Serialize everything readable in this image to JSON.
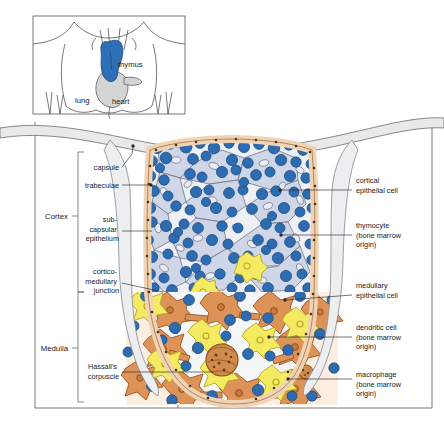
{
  "figure": {
    "type": "anatomical-histology-diagram"
  },
  "inset": {
    "name": "thorax-location-inset",
    "labels": [
      {
        "id": "thymus",
        "text": "thymus",
        "x": 118,
        "y": 67
      },
      {
        "id": "lung",
        "text": "lung",
        "x": 75,
        "y": 103
      },
      {
        "id": "heart",
        "text": "heart",
        "x": 112,
        "y": 104
      }
    ],
    "colors": {
      "thymus": "#2f6fb5",
      "heart": "#d4d4d4",
      "outline": "#4a4a4a"
    }
  },
  "regions": [
    {
      "id": "cortex",
      "label": "Cortex",
      "x": 46,
      "y": 216,
      "top": 152,
      "bottom": 292
    },
    {
      "id": "medulla",
      "label": "Medulla",
      "x": 43,
      "y": 348,
      "top": 292,
      "bottom": 402
    }
  ],
  "left_labels": [
    {
      "id": "capsule",
      "lines": [
        "capsule"
      ],
      "x": 119,
      "y": 170,
      "anchor": "end",
      "leader": [
        [
          122,
          167
        ],
        [
          134,
          153
        ],
        [
          134,
          146
        ]
      ]
    },
    {
      "id": "trabeculae",
      "lines": [
        "trabeculae"
      ],
      "x": 119,
      "y": 187,
      "anchor": "end",
      "leader": [
        [
          122,
          185
        ],
        [
          151,
          185
        ]
      ]
    },
    {
      "id": "subcapsular-epithelium",
      "lines": [
        "sub-",
        "capsular",
        "epithelium"
      ],
      "x": 119,
      "y": 222,
      "anchor": "end",
      "leader": [
        [
          122,
          231
        ],
        [
          152,
          231
        ]
      ]
    },
    {
      "id": "corticomedullary-junction",
      "lines": [
        "cortico-",
        "medullary",
        "junction"
      ],
      "x": 119,
      "y": 274,
      "anchor": "end",
      "leader": [
        [
          122,
          283
        ],
        [
          163,
          292
        ]
      ]
    },
    {
      "id": "hassalls-corpuscle",
      "lines": [
        "Hassall's",
        "corpuscle"
      ],
      "x": 119,
      "y": 366,
      "anchor": "end",
      "leader": [
        [
          122,
          372
        ],
        [
          215,
          372
        ]
      ]
    }
  ],
  "right_labels": [
    {
      "id": "cortical-epithelial-cell",
      "lines": [
        "cortical",
        "epithelial cell"
      ],
      "x": 355,
      "y": 183,
      "anchor": "start",
      "leader": [
        [
          352,
          190
        ],
        [
          281,
          190
        ]
      ]
    },
    {
      "id": "thymocyte",
      "lines": [
        "thymocyte",
        "(bone marrow",
        "origin)"
      ],
      "x": 355,
      "y": 228,
      "anchor": "start",
      "leader": [
        [
          352,
          235
        ],
        [
          281,
          235
        ]
      ]
    },
    {
      "id": "medullary-epithelial-cell",
      "lines": [
        "medullary",
        "epithelial cell"
      ],
      "x": 355,
      "y": 288,
      "anchor": "start",
      "leader": [
        [
          352,
          295
        ],
        [
          285,
          300
        ]
      ]
    },
    {
      "id": "dendritic-cell",
      "lines": [
        "dendritic cell",
        "(bone marrow",
        "origin)"
      ],
      "x": 355,
      "y": 330,
      "anchor": "start",
      "leader": [
        [
          352,
          337
        ],
        [
          269,
          337
        ]
      ]
    },
    {
      "id": "macrophage",
      "lines": [
        "macrophage",
        "(bone marrow",
        "origin)"
      ],
      "x": 355,
      "y": 377,
      "anchor": "start",
      "leader": [
        [
          352,
          379
        ],
        [
          288,
          379
        ]
      ]
    }
  ],
  "colors": {
    "thymocyte_fill": "#2e6cb2",
    "thymocyte_stroke": "#1b4a80",
    "cortical_epithelium_fill": "#ced6e8",
    "cortical_epithelium_stroke": "#6a6f7e",
    "medullary_epithelium_fill": "#dd9258",
    "medullary_epithelium_stroke": "#9a5220",
    "dendritic_fill": "#f4eb63",
    "dendritic_stroke": "#b3a01e",
    "macrophage_fill": "#d08a4e",
    "macrophage_stroke": "#8a4a18",
    "capsule_fill": "#e9e9e9",
    "capsule_stroke": "#6b6b6b",
    "subcapsular_fill": "#f0d2b4",
    "subcapsular_stroke": "#a9784d",
    "medulla_wash": "#fcefe2",
    "trabecula_fill": "#eceef0",
    "frame_stroke": "#555555"
  }
}
